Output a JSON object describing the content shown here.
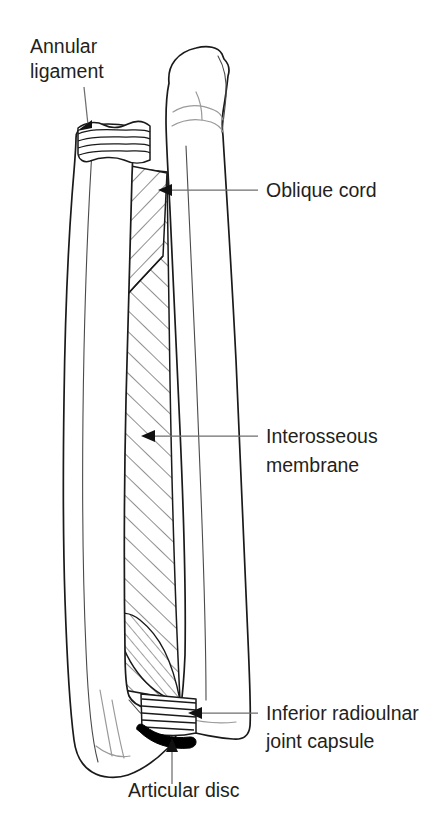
{
  "figure": {
    "background_color": "#ffffff",
    "ink_color": "#231f20",
    "leader_color": "#6e6e6e"
  },
  "labels": [
    {
      "id": "annular-ligament",
      "line1": "Annular",
      "line2": "ligament",
      "text_x": 30,
      "text_y1": 53,
      "text_y2": 78,
      "leader": "M 83 88 L 86 128",
      "arrow_at": [
        80,
        129
      ],
      "arrow_dir": "down-left"
    },
    {
      "id": "oblique-cord",
      "line1": "Oblique cord",
      "line2": "",
      "text_x": 266,
      "text_y1": 197,
      "text_y2": 0,
      "leader": "M 256 190 L 166 190",
      "arrow_at": [
        160,
        190
      ],
      "arrow_dir": "left"
    },
    {
      "id": "interosseous-membrane",
      "line1": "Interosseous",
      "line2": "membrane",
      "text_x": 266,
      "text_y1": 443,
      "text_y2": 472,
      "leader": "M 256 436 L 149 436",
      "arrow_at": [
        142,
        436
      ],
      "arrow_dir": "left"
    },
    {
      "id": "inferior-radioulnar-joint-capsule",
      "line1": "Inferior radioulnar",
      "line2": "joint capsule",
      "text_x": 266,
      "text_y1": 720,
      "text_y2": 748,
      "leader": "M 256 713 L 196 713",
      "arrow_at": [
        189,
        713
      ],
      "arrow_dir": "left"
    },
    {
      "id": "articular-disc",
      "line1": "Articular disc",
      "line2": "",
      "text_x": 128,
      "text_y1": 797,
      "text_y2": 0,
      "leader": "M 174 782 L 174 745",
      "arrow_at": [
        174,
        738
      ],
      "arrow_dir": "up"
    }
  ],
  "structures": [
    {
      "id": "ulna",
      "name": "Ulna",
      "side": "right"
    },
    {
      "id": "radius",
      "name": "Radius",
      "side": "left"
    },
    {
      "id": "annular-ligament-band",
      "name": "Annular ligament band",
      "pattern": "horizontal-stripes"
    },
    {
      "id": "oblique-cord-patch",
      "name": "Oblique cord",
      "pattern": "diagonal-hatch-reverse"
    },
    {
      "id": "interosseous-membrane-sheet",
      "name": "Interosseous membrane",
      "pattern": "diagonal-hatch"
    },
    {
      "id": "inferior-radioulnar-capsule-band",
      "name": "Inferior radioulnar joint capsule",
      "pattern": "horizontal-stripes"
    },
    {
      "id": "articular-disc-band",
      "name": "Articular disc",
      "pattern": "solid-black"
    }
  ]
}
